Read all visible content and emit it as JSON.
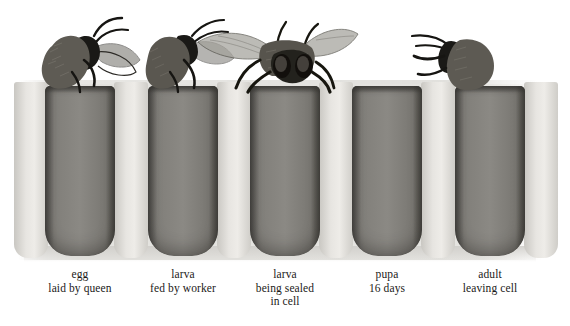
{
  "figure": {
    "background_color": "#ffffff",
    "comb_color": "#e3e2de",
    "cell_color": "#85837e",
    "partition_color": "#e7e5e1",
    "ink_color": "#1b1a18"
  },
  "stages": [
    {
      "id": "stage-egg",
      "title": "egg",
      "subtitle": "laid by queen",
      "subtitle2": "",
      "contents": "queen bee inserting abdomen into cell",
      "cell_x": 45
    },
    {
      "id": "stage-larva-fed",
      "title": "larva",
      "subtitle": "fed by worker",
      "subtitle2": "",
      "contents": "worker bee feeding small curled larva in royal jelly",
      "cell_x": 148
    },
    {
      "id": "stage-larva-sealed",
      "title": "larva",
      "subtitle": "being sealed",
      "subtitle2": "in cell",
      "contents": "large segmented C-shaped larva filling the cell",
      "cell_x": 250
    },
    {
      "id": "stage-pupa",
      "title": "pupa",
      "subtitle": "16 days",
      "subtitle2": "",
      "contents": "developing pupa with compound eye, folded legs and segmented abdomen",
      "cell_x": 352
    },
    {
      "id": "stage-adult",
      "title": "adult",
      "subtitle": "leaving cell",
      "subtitle2": "",
      "contents": "adult bee emerging head-first from the cell",
      "cell_x": 455
    }
  ],
  "bees": [
    {
      "id": "bee-queen",
      "name": "queen bee depositing egg"
    },
    {
      "id": "bee-worker",
      "name": "worker bee feeding larva"
    },
    {
      "id": "bee-front",
      "name": "bee facing forward with spread wings"
    },
    {
      "id": "bee-capper",
      "name": "bee capping the cell"
    }
  ]
}
